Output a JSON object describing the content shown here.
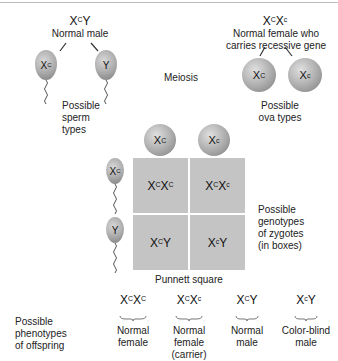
{
  "father": {
    "genotype_base": "X",
    "genotype_sup": "C",
    "genotype_tail": "Y",
    "label": "Normal male"
  },
  "mother": {
    "genotype_base": "X",
    "genotype_sup": "C",
    "genotype_base2": "X",
    "genotype_sup2": "c",
    "label_line1": "Normal female who",
    "label_line2": "carries recessive gene"
  },
  "meiosis_label": "Meiosis",
  "sperm": {
    "types": [
      {
        "base": "X",
        "sup": "C"
      },
      {
        "base": "Y",
        "sup": ""
      }
    ],
    "label_lines": [
      "Possible",
      "sperm",
      "types"
    ]
  },
  "ova": {
    "types": [
      {
        "base": "X",
        "sup": "C"
      },
      {
        "base": "X",
        "sup": "c"
      }
    ],
    "label_lines": [
      "Possible",
      "ova types"
    ]
  },
  "punnett": {
    "title": "Punnett square",
    "cells": [
      {
        "a": "X",
        "as": "C",
        "b": "X",
        "bs": "C"
      },
      {
        "a": "X",
        "as": "C",
        "b": "X",
        "bs": "c"
      },
      {
        "a": "X",
        "as": "C",
        "b": "Y",
        "bs": ""
      },
      {
        "a": "X",
        "as": "c",
        "b": "Y",
        "bs": ""
      }
    ],
    "side_label_lines": [
      "Possible",
      "genotypes",
      "of zygotes",
      "(in boxes)"
    ]
  },
  "phenotypes": {
    "label_lines": [
      "Possible",
      "phenotypes",
      "of offspring"
    ],
    "items": [
      {
        "a": "X",
        "as": "C",
        "b": "X",
        "bs": "C",
        "lines": [
          "Normal",
          "female"
        ]
      },
      {
        "a": "X",
        "as": "C",
        "b": "X",
        "bs": "c",
        "lines": [
          "Normal",
          "female",
          "(carrier)"
        ]
      },
      {
        "a": "X",
        "as": "C",
        "b": "Y",
        "bs": "",
        "lines": [
          "Normal",
          "male"
        ]
      },
      {
        "a": "X",
        "as": "c",
        "b": "Y",
        "bs": "",
        "lines": [
          "Color-blind",
          "male"
        ]
      }
    ]
  },
  "colors": {
    "cell": "#c4c4c4",
    "gamete": "#a8a8a8",
    "text": "#222222"
  }
}
